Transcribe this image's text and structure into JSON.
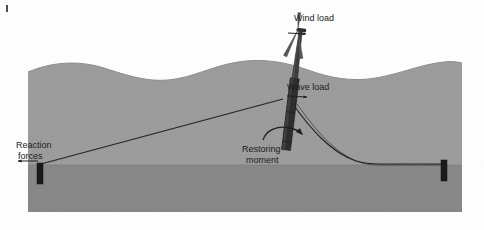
{
  "figure": {
    "width": 484,
    "height": 230
  },
  "colors": {
    "background": "#ffffff",
    "water": "#9b9b9b",
    "seabed": "#868686",
    "water_edge": "#8f8f8f",
    "structure": "#2e2e2e",
    "line": "#1e1e1e",
    "text": "#1b1b1b",
    "tower_light": "#6d6d6d",
    "anchor": "#1a1a1a"
  },
  "labels": {
    "wind_load": "Wind load",
    "wave_load": "Wave load",
    "restoring_moment_line1": "Restoring",
    "restoring_moment_line2": "moment",
    "reaction_forces_line1": "Reaction",
    "reaction_forces_line2": "forces"
  },
  "scene_elements": {
    "water_body": "water-region",
    "seabed_body": "seabed-region",
    "wave_surface": "wave-surface-profile",
    "spar_platform": "spar-buoy-platform",
    "tower": "turbine-tower",
    "nacelle": "turbine-nacelle",
    "rotor_blades": "rotor-blades",
    "mooring_line_left": "taut-mooring-line-left",
    "mooring_line_right": "catenary-mooring-line-right",
    "anchor_left": "seabed-anchor-left",
    "anchor_right": "seabed-anchor-right",
    "wind_arrow": "wind-load-arrow",
    "wave_arrow": "wave-load-arrow",
    "moment_arrow": "restoring-moment-arrow",
    "reaction_arrow": "reaction-forces-arrow"
  },
  "geometry": {
    "water_surface_mean_y": 72,
    "seabed_y": 165,
    "scene_bottom_y": 212,
    "anchor_left_x": 40,
    "anchor_right_x": 444,
    "spar_base_x": 285,
    "tower_top_y": 12,
    "tilt_degrees": 7
  }
}
